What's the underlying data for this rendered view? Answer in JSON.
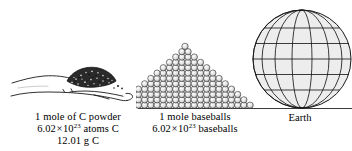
{
  "figure": {
    "background_color": "#ffffff",
    "ink_color": "#000000",
    "ground_line_color": "#3a3a3a"
  },
  "panels": [
    {
      "id": "carbon",
      "icon_name": "hand-with-carbon-powder-illustration",
      "caption_lines": [
        "1 mole of C powder",
        "6.02 × 10²³ atoms C",
        "12.01 g C"
      ],
      "caption": {
        "line1": "1 mole of C powder",
        "line2_prefix": "6.02",
        "line2_times": "×",
        "line2_base": "10",
        "line2_exponent": "23",
        "line2_suffix": "atoms C",
        "line3": "12.01 g C"
      }
    },
    {
      "id": "baseballs",
      "icon_name": "baseball-pyramid-illustration",
      "caption_lines": [
        "1 mole baseballs",
        "6.02 × 10²³ baseballs"
      ],
      "caption": {
        "line1": "1 mole baseballs",
        "line2_prefix": "6.02",
        "line2_times": "×",
        "line2_base": "10",
        "line2_exponent": "23",
        "line2_suffix": "baseballs"
      }
    },
    {
      "id": "earth",
      "icon_name": "globe-wireframe-illustration",
      "caption_lines": [
        "Earth"
      ],
      "caption": {
        "line1": "Earth"
      }
    }
  ]
}
